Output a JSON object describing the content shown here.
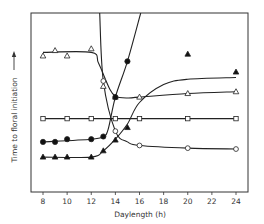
{
  "chart_data": {
    "type": "line",
    "title": "",
    "xlabel": "Daylength (h)",
    "ylabel": "Time to floral initiation",
    "ylabel_arrow": true,
    "xlim": [
      8,
      24
    ],
    "x_ticks": [
      8,
      10,
      12,
      14,
      16,
      18,
      20,
      22,
      24
    ],
    "y_ticks": [],
    "grid": false,
    "legend": null,
    "y_units": "relative (no scale shown; 0 = bottom axis, 100 = top of frame)",
    "series": [
      {
        "name": "open-triangles",
        "marker": "open-triangle",
        "points": [
          [
            8,
            76
          ],
          [
            9,
            79
          ],
          [
            10,
            76
          ],
          [
            12,
            80
          ],
          [
            13,
            59
          ],
          [
            14,
            53
          ],
          [
            16,
            53
          ],
          [
            20,
            55
          ],
          [
            24,
            56
          ]
        ],
        "curve": [
          [
            8,
            78
          ],
          [
            12,
            78
          ],
          [
            12.6,
            72
          ],
          [
            13.5,
            58
          ],
          [
            14,
            53.5
          ],
          [
            15,
            52.5
          ],
          [
            16,
            53
          ],
          [
            20,
            55
          ],
          [
            24,
            56
          ]
        ]
      },
      {
        "name": "open-squares",
        "marker": "open-square",
        "points": [
          [
            8,
            41
          ],
          [
            10,
            41
          ],
          [
            12,
            41
          ],
          [
            14,
            41
          ],
          [
            16,
            41
          ],
          [
            20,
            41
          ],
          [
            24,
            41
          ]
        ],
        "curve": [
          [
            8,
            41
          ],
          [
            24,
            41
          ]
        ]
      },
      {
        "name": "closed-circles",
        "marker": "filled-circle",
        "points": [
          [
            8,
            28
          ],
          [
            9,
            28
          ],
          [
            10,
            29.5
          ],
          [
            12,
            29.5
          ],
          [
            13,
            31
          ],
          [
            14,
            53
          ],
          [
            15,
            73
          ]
        ],
        "curve": [
          [
            8,
            28
          ],
          [
            12,
            29.5
          ],
          [
            13,
            31
          ],
          [
            13.4,
            35
          ],
          [
            14,
            53
          ],
          [
            15,
            73
          ],
          [
            16.1,
            100
          ]
        ]
      },
      {
        "name": "closed-triangles",
        "marker": "filled-triangle",
        "points": [
          [
            8,
            19.5
          ],
          [
            9,
            19.5
          ],
          [
            10,
            19.5
          ],
          [
            12,
            19.5
          ],
          [
            13,
            23
          ],
          [
            14,
            29
          ],
          [
            15,
            36
          ],
          [
            20,
            77
          ],
          [
            24,
            67
          ]
        ],
        "curve": [
          [
            8,
            19.5
          ],
          [
            12,
            19.5
          ],
          [
            13,
            23
          ],
          [
            14,
            29.5
          ],
          [
            15,
            38
          ],
          [
            16,
            50
          ],
          [
            18,
            60
          ],
          [
            20,
            63
          ],
          [
            24,
            64
          ]
        ]
      },
      {
        "name": "open-circles",
        "marker": "open-circle",
        "points": [
          [
            13,
            62
          ],
          [
            14,
            34
          ],
          [
            16,
            26
          ],
          [
            20,
            24.5
          ],
          [
            24,
            24
          ]
        ],
        "curve": [
          [
            12.7,
            100
          ],
          [
            13,
            62
          ],
          [
            14,
            34
          ],
          [
            15,
            28
          ],
          [
            16,
            26
          ],
          [
            20,
            24.5
          ],
          [
            24,
            24
          ]
        ]
      }
    ]
  },
  "axes": {
    "x_title": "Daylength (h)",
    "y_title": "Time to floral initiation",
    "x_tick_labels": [
      "8",
      "10",
      "12",
      "14",
      "16",
      "18",
      "20",
      "22",
      "24"
    ]
  }
}
